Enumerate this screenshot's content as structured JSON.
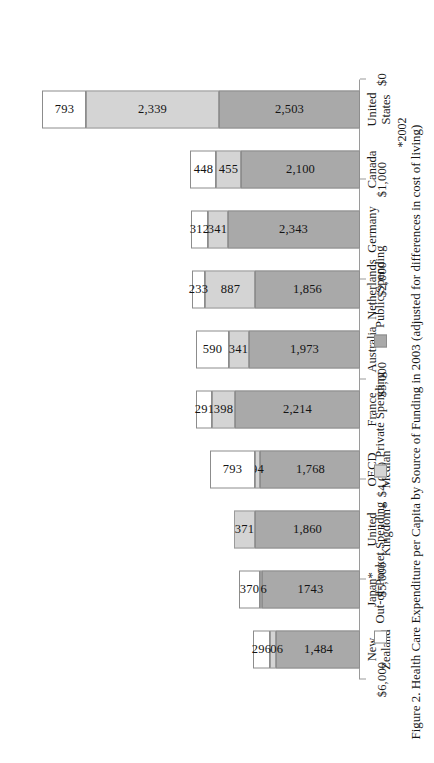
{
  "figure": {
    "caption": "Figure 2. Health Care Expenditure per Capita by Source of Funding in 2003 (adjusted for differences in cost of living)",
    "footnote": "*2002"
  },
  "legend": {
    "position": "top-left",
    "items": [
      {
        "label": "Out-of-Pocket Spending",
        "key": "oop",
        "color": "#ffffff"
      },
      {
        "label": "Private Spending",
        "key": "private",
        "color": "#d4d4d4"
      },
      {
        "label": "Public Spending",
        "key": "public",
        "color": "#a9a9a9"
      }
    ]
  },
  "axis": {
    "ticks": [
      "$0",
      "$1,000",
      "$2,000",
      "$3,000",
      "$4,000",
      "$5,000",
      "$6,000"
    ],
    "min": 0,
    "max": 6000,
    "step": 1000
  },
  "chart_data": {
    "type": "bar",
    "orientation": "horizontal-stacked",
    "title": "Figure 2. Health Care Expenditure per Capita by Source of Funding in 2003 (adjusted for differences in cost of living)",
    "xlabel": "",
    "ylabel": "",
    "xlim": [
      0,
      6000
    ],
    "grid": false,
    "legend_position": "top-left",
    "categories": [
      "United\nStates",
      "Canada",
      "Germany",
      "Netherlands",
      "Australia",
      "France",
      "OECD\nMedian",
      "United\nKingdom*",
      "Japan*",
      "New\nZealand"
    ],
    "series": [
      {
        "name": "Public Spending",
        "color": "#a9a9a9",
        "values": [
          2503,
          2100,
          2343,
          1856,
          1973,
          2214,
          1768,
          1860,
          1743,
          1484
        ],
        "value_labels": [
          "2,503",
          "2,100",
          "2,343",
          "1,856",
          "1,973",
          "2,214",
          "1,768",
          "1,860",
          "1743",
          "1,484"
        ]
      },
      {
        "name": "Private Spending",
        "color": "#d4d4d4",
        "values": [
          2339,
          455,
          341,
          887,
          341,
          398,
          94,
          371,
          26,
          106
        ],
        "value_labels": [
          "2,339",
          "455",
          "341",
          "887",
          "341",
          "398",
          "94",
          "371",
          "26",
          "106"
        ]
      },
      {
        "name": "Out-of-Pocket Spending",
        "color": "#ffffff",
        "values": [
          793,
          448,
          312,
          233,
          590,
          291,
          793,
          0,
          370,
          296
        ],
        "value_labels": [
          "793",
          "448",
          "312",
          "233",
          "590",
          "291",
          "793",
          "",
          "370",
          "296"
        ]
      }
    ]
  }
}
